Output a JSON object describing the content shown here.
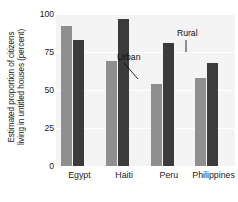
{
  "chart_data": {
    "type": "bar",
    "title": "",
    "xlabel": "",
    "ylabel": "Estimated proportion of citizens living in untitled houses (percent)",
    "ylabel_line1": "Estimated proportion of citizens",
    "ylabel_line2": "living in untitled houses (percent)",
    "categories": [
      "Egypt",
      "Haiti",
      "Peru",
      "Philippines"
    ],
    "series": [
      {
        "name": "Urban",
        "color": "#8f8f8f",
        "values": [
          92,
          69,
          54,
          58
        ]
      },
      {
        "name": "Rural",
        "color": "#3b3b3b",
        "values": [
          83,
          97,
          81,
          68
        ]
      }
    ],
    "ylim": [
      0,
      100
    ],
    "yticks": [
      0,
      25,
      50,
      75,
      100
    ],
    "ytick_labels": [
      "0",
      "25",
      "50",
      "75",
      "100"
    ],
    "grid": true,
    "grid_color": "#ffffff",
    "plot_background": "#f4f4f4",
    "legend_position": "annotations-on-last-group",
    "annotations": [
      {
        "text": "Urban",
        "points_to": "philippines-urban-bar"
      },
      {
        "text": "Rural",
        "points_to": "philippines-rural-bar"
      }
    ]
  }
}
